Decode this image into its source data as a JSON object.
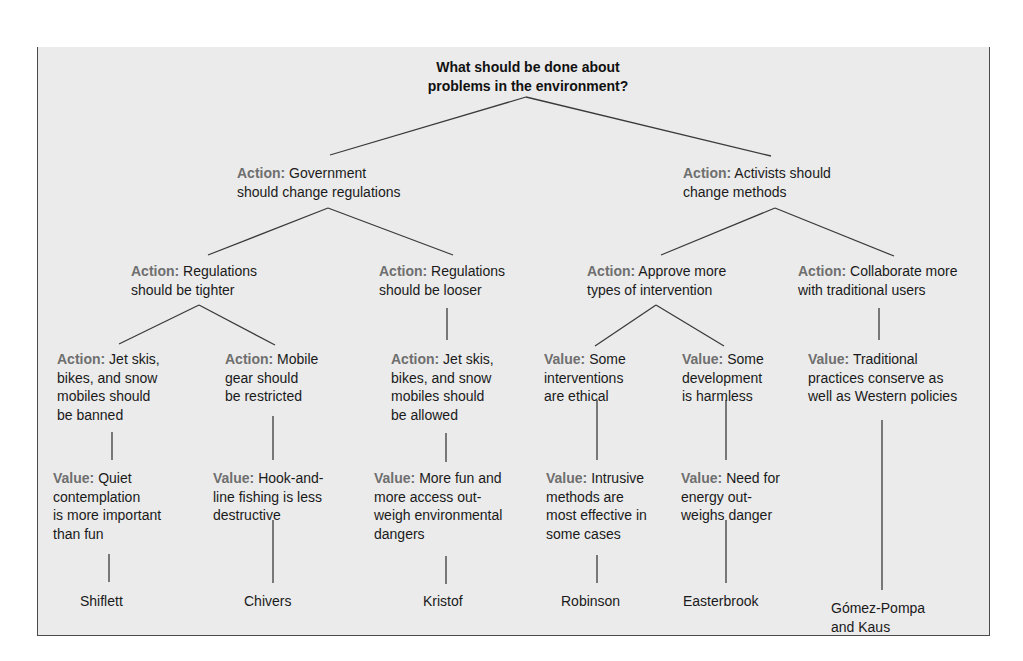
{
  "diagram": {
    "root": {
      "lines": [
        "What should be done about",
        "problems in the environment?"
      ]
    },
    "level1": [
      {
        "kind": "Action:",
        "lines": [
          " Government",
          "should change regulations"
        ]
      },
      {
        "kind": "Action:",
        "lines": [
          " Activists should",
          "change methods"
        ]
      }
    ],
    "level2": [
      {
        "kind": "Action:",
        "lines": [
          " Regulations",
          "should be tighter"
        ]
      },
      {
        "kind": "Action:",
        "lines": [
          " Regulations",
          "should be looser"
        ]
      },
      {
        "kind": "Action:",
        "lines": [
          " Approve more",
          "types of intervention"
        ]
      },
      {
        "kind": "Action:",
        "lines": [
          " Collaborate more",
          "with traditional users"
        ]
      }
    ],
    "level3": [
      {
        "kind": "Action:",
        "lines": [
          " Jet skis,",
          "bikes, and snow",
          "mobiles should",
          "be banned"
        ]
      },
      {
        "kind": "Action:",
        "lines": [
          " Mobile",
          "gear should",
          "be restricted"
        ]
      },
      {
        "kind": "Action:",
        "lines": [
          " Jet skis,",
          "bikes, and snow",
          "mobiles should",
          "be allowed"
        ]
      },
      {
        "kind": "Value:",
        "lines": [
          " Some",
          "interventions",
          "are ethical"
        ]
      },
      {
        "kind": "Value:",
        "lines": [
          " Some",
          "development",
          "is harmless"
        ]
      },
      {
        "kind": "Value:",
        "lines": [
          " Traditional",
          "practices conserve as",
          "well as Western policies"
        ]
      }
    ],
    "level4": [
      {
        "kind": "Value:",
        "lines": [
          " Quiet",
          "contemplation",
          "is more important",
          "than fun"
        ]
      },
      {
        "kind": "Value:",
        "lines": [
          " Hook-and-",
          "line fishing is less",
          "destructive"
        ]
      },
      {
        "kind": "Value:",
        "lines": [
          " More fun and",
          "more access out-",
          "weigh environmental",
          "dangers"
        ]
      },
      {
        "kind": "Value:",
        "lines": [
          " Intrusive",
          "methods are",
          "most effective in",
          "some cases"
        ]
      },
      {
        "kind": "Value:",
        "lines": [
          " Need for",
          "energy out-",
          "weighs danger"
        ]
      }
    ],
    "authors": [
      {
        "lines": [
          "Shiflett"
        ]
      },
      {
        "lines": [
          "Chivers"
        ]
      },
      {
        "lines": [
          "Kristof"
        ]
      },
      {
        "lines": [
          "Robinson"
        ]
      },
      {
        "lines": [
          "Easterbrook"
        ]
      },
      {
        "lines": [
          "Gómez-Pompa",
          "and Kaus"
        ]
      }
    ],
    "colors": {
      "label_gray": "#6f6f6f",
      "text": "#1a1a1a",
      "background": "#ebebeb",
      "connector": "#3a3a3a"
    }
  }
}
